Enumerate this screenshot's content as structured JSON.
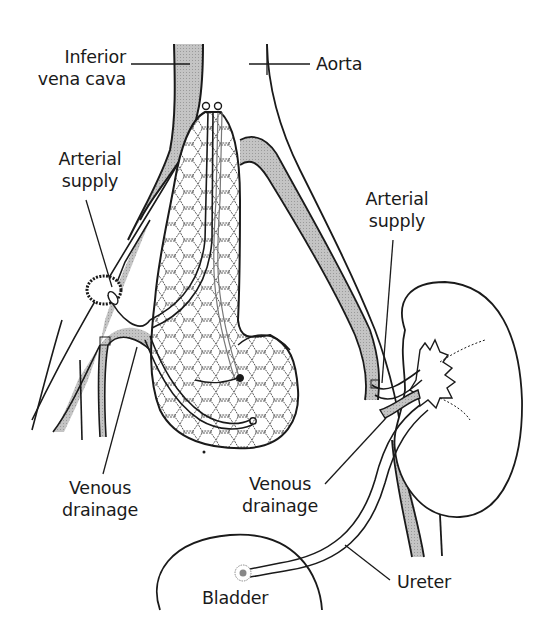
{
  "diagram": {
    "colors": {
      "line": "#1a1a1a",
      "vessel_fill": "#b8b8b8",
      "background": "#ffffff"
    },
    "labels": {
      "ivc": {
        "line1": "Inferior",
        "line2": "vena cava"
      },
      "aorta": {
        "text": "Aorta"
      },
      "arterial_left": {
        "line1": "Arterial",
        "line2": "supply"
      },
      "arterial_right": {
        "line1": "Arterial",
        "line2": "supply"
      },
      "venous_left": {
        "line1": "Venous",
        "line2": "drainage"
      },
      "venous_right": {
        "line1": "Venous",
        "line2": "drainage"
      },
      "ureter": {
        "text": "Ureter"
      },
      "bladder": {
        "text": "Bladder"
      }
    },
    "structures": [
      "inferior-vena-cava",
      "aorta",
      "pancreas-graft",
      "kidney-graft",
      "ureter",
      "bladder",
      "iliac-vessels"
    ]
  }
}
